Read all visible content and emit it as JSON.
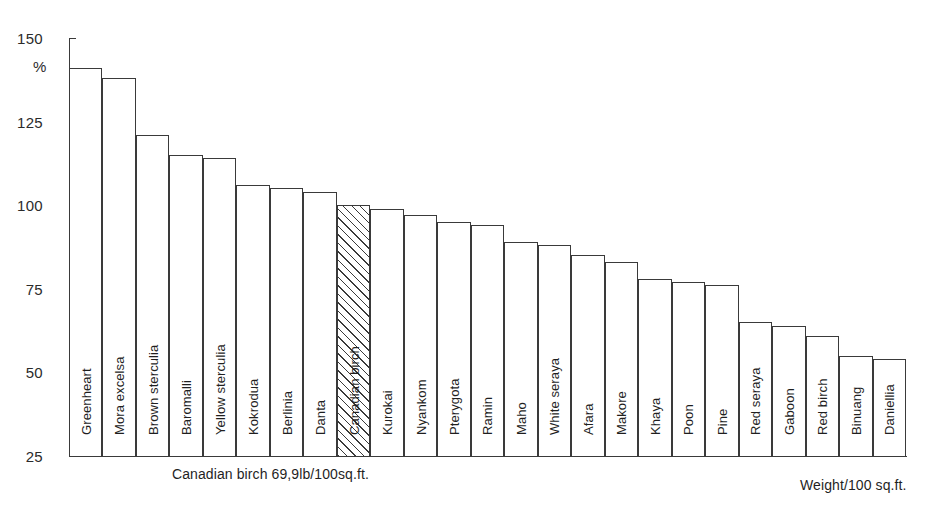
{
  "chart_data": {
    "type": "bar",
    "title": "",
    "subtitle": "",
    "xlabel": "Weight/100 sq.ft.",
    "ylabel": "%",
    "ylim": [
      25,
      150
    ],
    "yticks": [
      25,
      50,
      75,
      100,
      125,
      150
    ],
    "grid": false,
    "legend": null,
    "reference_note": "Canadian birch 69,9lb/100sq.ft.",
    "highlighted_category": "Canadian birch",
    "highlight_style": "diagonal-hatch",
    "categories": [
      "Greenheart",
      "Mora excelsa",
      "Brown sterculia",
      "Baromalli",
      "Yellow sterculia",
      "Kokrodua",
      "Berlinia",
      "Danta",
      "Canadian birch",
      "Kurokai",
      "Nyankom",
      "Pterygota",
      "Ramin",
      "Maho",
      "White seraya",
      "Afara",
      "Makore",
      "Khaya",
      "Poon",
      "Pine",
      "Red seraya",
      "Gaboon",
      "Red birch",
      "Binuang",
      "Daniellia"
    ],
    "values": [
      141,
      138,
      121,
      115,
      114,
      106,
      105,
      104,
      100,
      99,
      97,
      95,
      94,
      89,
      88,
      85,
      83,
      78,
      77,
      76,
      65,
      64,
      61,
      55,
      54
    ]
  },
  "axis": {
    "y_unit_label": "%",
    "tick_labels": [
      "150",
      "125",
      "100",
      "75",
      "50",
      "25"
    ]
  },
  "footnotes": {
    "reference": "Canadian birch 69,9lb/100sq.ft.",
    "x_axis_units": "Weight/100 sq.ft."
  },
  "page_caption": {
    "text": ""
  }
}
